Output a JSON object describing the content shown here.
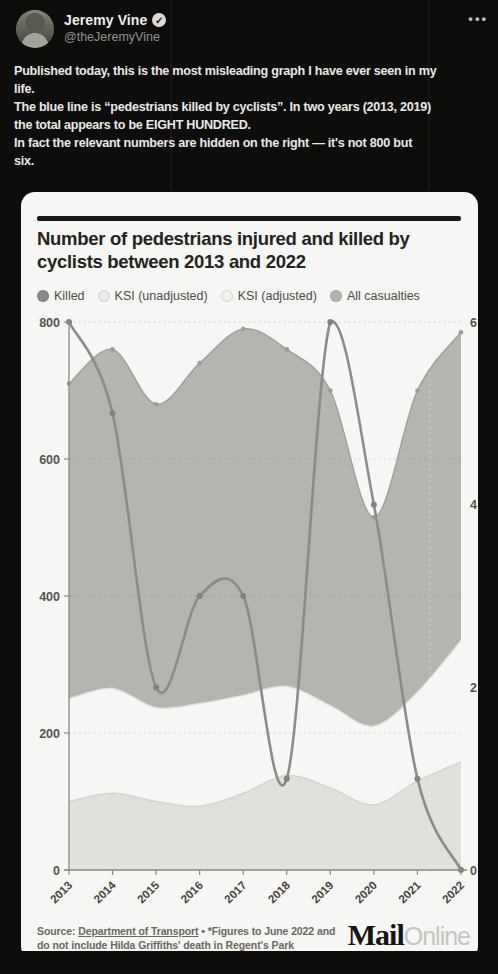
{
  "tweet": {
    "author_name": "Jeremy Vine",
    "handle": "@theJeremyVine",
    "verified_icon": "check-badge",
    "more_icon": "ellipsis",
    "more_label": "•••",
    "lines": [
      "Published today, this is the most misleading graph I have ever seen in my",
      "life.",
      "The blue line is “pedestrians killed by cyclists”. In two years (2013, 2019)",
      "the total appears to be EIGHT HUNDRED.",
      "In fact the relevant numbers are hidden on the right — it's not 800 but",
      "six."
    ]
  },
  "card": {
    "title": "Number of pedestrians injured and killed by cyclists between 2013 and 2022",
    "legend": [
      {
        "label": "Killed",
        "color": "#8a8a86"
      },
      {
        "label": "KSI (unadjusted)",
        "color": "#e9e9e6"
      },
      {
        "label": "KSI (adjusted)",
        "color": "#f1f1ee"
      },
      {
        "label": "All casualties",
        "color": "#b3b2af"
      }
    ],
    "footer": {
      "source_prefix": "Source: ",
      "source_link": "Department of Transport",
      "note_line1": " • *Figures to June 2022 and",
      "note_line2": "do not include Hilda Griffiths' death in Regent's Park"
    },
    "brand": {
      "mail": "Mail",
      "online": "Online"
    }
  },
  "chart_data": {
    "type": "area",
    "title": "Number of pedestrians injured and killed by cyclists between 2013 and 2022",
    "x": [
      "2013",
      "2014",
      "2015",
      "2016",
      "2017",
      "2018",
      "2019",
      "2020",
      "2021",
      "2022"
    ],
    "series": [
      {
        "name": "All casualties",
        "kind": "area",
        "axis": "left",
        "fill": "#b5b4b1",
        "stroke": "#a09f9c",
        "values": [
          710,
          760,
          680,
          740,
          790,
          760,
          700,
          515,
          700,
          785
        ]
      },
      {
        "name": "KSI (unadjusted)",
        "kind": "area",
        "axis": "left",
        "fill": "#f6f6f4",
        "stroke": "#e0e0dd",
        "values": [
          250,
          265,
          237,
          243,
          255,
          268,
          240,
          210,
          260,
          335
        ]
      },
      {
        "name": "KSI (adjusted)",
        "kind": "area",
        "axis": "left",
        "fill": "#e0e0dd",
        "stroke": "#d4d4d0",
        "values": [
          100,
          112,
          100,
          93,
          112,
          138,
          120,
          95,
          130,
          158
        ]
      },
      {
        "name": "Killed",
        "kind": "line",
        "axis": "right",
        "stroke": "#8c8c88",
        "values": [
          6,
          5,
          2,
          3,
          3,
          1,
          6,
          4,
          1,
          0
        ]
      }
    ],
    "left_axis": {
      "range": [
        0,
        800
      ],
      "ticks": [
        0,
        200,
        400,
        600,
        800
      ]
    },
    "right_axis": {
      "range": [
        0,
        6
      ],
      "ticks": [
        0,
        2,
        4,
        6
      ]
    },
    "grid": "horizontal-dotted",
    "legend_position": "top",
    "xlabel": "",
    "ylabel": ""
  }
}
